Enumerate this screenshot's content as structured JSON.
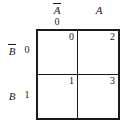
{
  "figure": {
    "kind": "karnaugh-map",
    "variables": [
      "A",
      "B"
    ],
    "colors": {
      "line": "#1a1a1a",
      "background": "#ffffff",
      "text": "#1a1a1a"
    }
  },
  "columns": {
    "headers": [
      {
        "label": "A",
        "negated": true,
        "index": "0"
      },
      {
        "label": "A",
        "negated": false,
        "index": "1"
      }
    ]
  },
  "rows": {
    "headers": [
      {
        "label": "B",
        "negated": true,
        "index": "0"
      },
      {
        "label": "B",
        "negated": false,
        "index": "1"
      }
    ]
  },
  "cells": [
    {
      "index": "0",
      "row": "0",
      "col": "0",
      "value": ""
    },
    {
      "index": "2",
      "row": "0",
      "col": "1",
      "value": ""
    },
    {
      "index": "1",
      "row": "1",
      "col": "0",
      "value": ""
    },
    {
      "index": "3",
      "row": "1",
      "col": "1",
      "value": ""
    }
  ],
  "chart_data": {
    "type": "table",
    "title": "",
    "xlabel": "A",
    "ylabel": "B",
    "col_labels": [
      "A̅",
      "A"
    ],
    "col_values": [
      "0",
      "1"
    ],
    "row_labels": [
      "B̅",
      "B"
    ],
    "row_values": [
      "0",
      "1"
    ],
    "minterm_indices": [
      [
        0,
        2
      ],
      [
        1,
        3
      ]
    ],
    "cell_contents": [
      [
        "",
        ""
      ],
      [
        "",
        ""
      ]
    ],
    "grid": true,
    "legend": "none"
  }
}
